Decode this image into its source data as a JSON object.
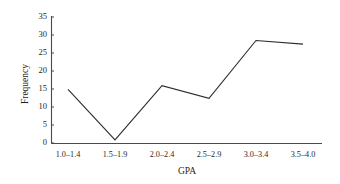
{
  "chart_data": {
    "type": "line",
    "title": "",
    "xlabel": "GPA",
    "ylabel": "Frequency",
    "categories": [
      "1.0–1.4",
      "1.5–1.9",
      "2.0–2.4",
      "2.5–2.9",
      "3.0–3.4",
      "3.5–4.0"
    ],
    "values": [
      15,
      1,
      16,
      12.5,
      28.5,
      27.5
    ],
    "ylim": [
      0,
      35
    ],
    "yticks": [
      0,
      5,
      10,
      15,
      20,
      25,
      30,
      35
    ],
    "ytick_labels": [
      "0",
      "5",
      "10",
      "15",
      "20",
      "25",
      "30",
      "35"
    ],
    "grid": false,
    "legend": false,
    "line_color": "#2e2e2e",
    "axis_color": "#4a4a4a",
    "background_color": "#ffffff"
  }
}
